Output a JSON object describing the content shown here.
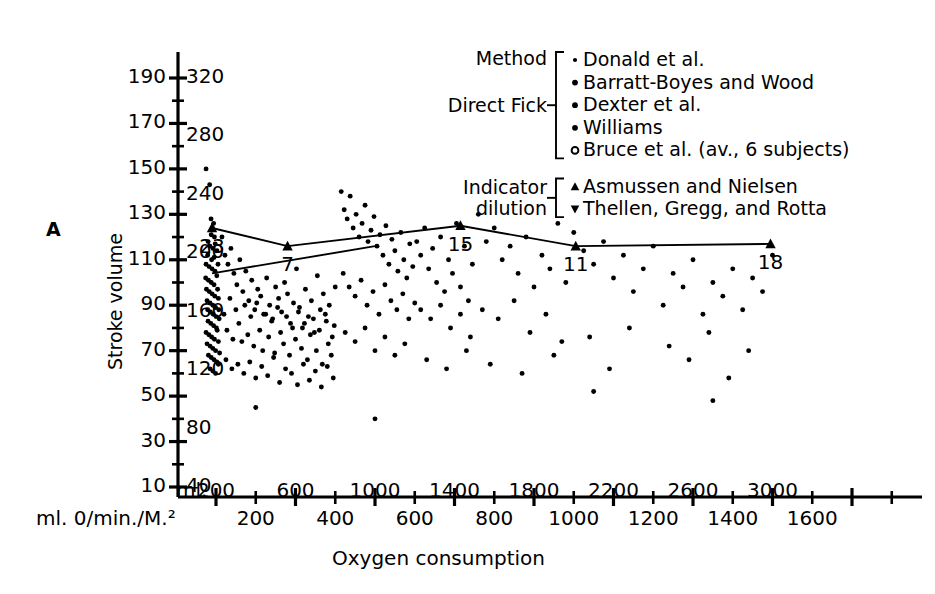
{
  "panel": {
    "label": "A"
  },
  "axes": {
    "y_title": "Stroke volume",
    "y_left_ticks": [
      190,
      170,
      150,
      130,
      110,
      90,
      70,
      50,
      30,
      10
    ],
    "y_right_ticks": [
      320,
      280,
      240,
      200,
      160,
      120,
      80,
      40
    ],
    "x_title": "Oxygen consumption",
    "x_unit_label": "ml. 0/min./M.²",
    "x_top_prefix": "ml.",
    "x_top_ticks": [
      200,
      600,
      1000,
      1400,
      1800,
      2200,
      2600,
      3000
    ],
    "x_bottom_ticks": [
      200,
      400,
      600,
      800,
      1000,
      1200,
      1400,
      1600
    ]
  },
  "legend": {
    "header": "Method",
    "groups": [
      {
        "name": "Direct Fick",
        "lines": [
          "Direct Fick"
        ],
        "entries": [
          {
            "marker": "dot-small",
            "label": "Donald et al."
          },
          {
            "marker": "dot",
            "label": "Barratt-Boyes and Wood"
          },
          {
            "marker": "dot",
            "label": "Dexter et al."
          },
          {
            "marker": "dot",
            "label": "Williams"
          },
          {
            "marker": "circle-open",
            "label": "Bruce et al. (av., 6 subjects)"
          }
        ]
      },
      {
        "name": "Indicator dilution",
        "lines": [
          "Indicator",
          "dilution"
        ],
        "entries": [
          {
            "marker": "triangle-up",
            "label": "Asmussen and Nielsen"
          },
          {
            "marker": "triangle-down",
            "label": "Thellen, Gregg, and Rotta"
          }
        ]
      }
    ]
  },
  "chart_data": {
    "type": "scatter",
    "title": "",
    "xlabel": "Oxygen consumption",
    "ylabel": "Stroke volume",
    "xlim": [
      0,
      3100
    ],
    "ylim": [
      10,
      200
    ],
    "grid": false,
    "legend_position": "top-right",
    "x_secondary_scale_ratio": 0.5,
    "mean_line": {
      "name": "mean stroke volume trend",
      "labels": [
        "23",
        "7",
        "15",
        "11",
        "18"
      ],
      "x": [
        180,
        560,
        1430,
        2010,
        2990
      ],
      "y": [
        124,
        116,
        125,
        116,
        117
      ],
      "marker": "triangle-up"
    },
    "regression_line": {
      "name": "lower trend line",
      "x": [
        180,
        1000
      ],
      "y": [
        104,
        116
      ]
    },
    "points": [
      [
        150,
        150
      ],
      [
        168,
        143
      ],
      [
        175,
        128
      ],
      [
        182,
        124
      ],
      [
        188,
        126
      ],
      [
        176,
        121
      ],
      [
        192,
        120
      ],
      [
        160,
        118
      ],
      [
        170,
        116
      ],
      [
        185,
        115
      ],
      [
        196,
        117
      ],
      [
        158,
        112
      ],
      [
        178,
        110
      ],
      [
        190,
        111
      ],
      [
        205,
        114
      ],
      [
        150,
        108
      ],
      [
        165,
        107
      ],
      [
        180,
        106
      ],
      [
        195,
        105
      ],
      [
        210,
        108
      ],
      [
        148,
        102
      ],
      [
        162,
        101
      ],
      [
        176,
        100
      ],
      [
        190,
        99
      ],
      [
        204,
        103
      ],
      [
        152,
        97
      ],
      [
        166,
        96
      ],
      [
        180,
        95
      ],
      [
        194,
        94
      ],
      [
        208,
        97
      ],
      [
        155,
        92
      ],
      [
        170,
        91
      ],
      [
        184,
        90
      ],
      [
        198,
        89
      ],
      [
        212,
        93
      ],
      [
        158,
        88
      ],
      [
        172,
        87
      ],
      [
        186,
        86
      ],
      [
        200,
        85
      ],
      [
        214,
        88
      ],
      [
        160,
        83
      ],
      [
        174,
        82
      ],
      [
        188,
        81
      ],
      [
        202,
        80
      ],
      [
        216,
        84
      ],
      [
        150,
        78
      ],
      [
        164,
        77
      ],
      [
        178,
        76
      ],
      [
        192,
        75
      ],
      [
        206,
        79
      ],
      [
        155,
        73
      ],
      [
        170,
        72
      ],
      [
        184,
        71
      ],
      [
        198,
        70
      ],
      [
        212,
        74
      ],
      [
        162,
        68
      ],
      [
        176,
        67
      ],
      [
        190,
        66
      ],
      [
        204,
        65
      ],
      [
        218,
        69
      ],
      [
        170,
        62
      ],
      [
        184,
        61
      ],
      [
        198,
        60
      ],
      [
        212,
        64
      ],
      [
        230,
        120
      ],
      [
        245,
        112
      ],
      [
        260,
        108
      ],
      [
        275,
        115
      ],
      [
        290,
        104
      ],
      [
        305,
        99
      ],
      [
        320,
        110
      ],
      [
        335,
        96
      ],
      [
        350,
        105
      ],
      [
        365,
        92
      ],
      [
        380,
        101
      ],
      [
        395,
        88
      ],
      [
        410,
        97
      ],
      [
        425,
        94
      ],
      [
        440,
        86
      ],
      [
        455,
        102
      ],
      [
        470,
        90
      ],
      [
        485,
        84
      ],
      [
        500,
        98
      ],
      [
        515,
        93
      ],
      [
        530,
        87
      ],
      [
        545,
        100
      ],
      [
        560,
        95
      ],
      [
        575,
        82
      ],
      [
        590,
        91
      ],
      [
        605,
        106
      ],
      [
        620,
        89
      ],
      [
        635,
        80
      ],
      [
        650,
        97
      ],
      [
        665,
        85
      ],
      [
        680,
        92
      ],
      [
        695,
        78
      ],
      [
        710,
        103
      ],
      [
        725,
        88
      ],
      [
        740,
        95
      ],
      [
        755,
        83
      ],
      [
        770,
        90
      ],
      [
        785,
        76
      ],
      [
        800,
        98
      ],
      [
        240,
        86
      ],
      [
        255,
        79
      ],
      [
        270,
        93
      ],
      [
        285,
        75
      ],
      [
        300,
        88
      ],
      [
        315,
        82
      ],
      [
        330,
        74
      ],
      [
        345,
        90
      ],
      [
        360,
        77
      ],
      [
        375,
        85
      ],
      [
        390,
        72
      ],
      [
        405,
        91
      ],
      [
        420,
        79
      ],
      [
        435,
        70
      ],
      [
        450,
        86
      ],
      [
        465,
        76
      ],
      [
        480,
        83
      ],
      [
        495,
        69
      ],
      [
        510,
        89
      ],
      [
        525,
        78
      ],
      [
        540,
        73
      ],
      [
        555,
        85
      ],
      [
        570,
        68
      ],
      [
        585,
        80
      ],
      [
        600,
        75
      ],
      [
        615,
        87
      ],
      [
        630,
        71
      ],
      [
        645,
        82
      ],
      [
        660,
        66
      ],
      [
        675,
        77
      ],
      [
        690,
        84
      ],
      [
        705,
        70
      ],
      [
        720,
        79
      ],
      [
        735,
        64
      ],
      [
        750,
        86
      ],
      [
        765,
        73
      ],
      [
        780,
        68
      ],
      [
        795,
        81
      ],
      [
        250,
        66
      ],
      [
        280,
        62
      ],
      [
        310,
        64
      ],
      [
        340,
        60
      ],
      [
        370,
        65
      ],
      [
        400,
        58
      ],
      [
        430,
        63
      ],
      [
        460,
        59
      ],
      [
        490,
        67
      ],
      [
        520,
        56
      ],
      [
        550,
        62
      ],
      [
        580,
        60
      ],
      [
        610,
        55
      ],
      [
        640,
        64
      ],
      [
        670,
        57
      ],
      [
        700,
        61
      ],
      [
        730,
        54
      ],
      [
        760,
        63
      ],
      [
        790,
        58
      ],
      [
        830,
        140
      ],
      [
        845,
        132
      ],
      [
        860,
        128
      ],
      [
        875,
        138
      ],
      [
        890,
        124
      ],
      [
        905,
        130
      ],
      [
        920,
        120
      ],
      [
        935,
        126
      ],
      [
        950,
        134
      ],
      [
        965,
        118
      ],
      [
        980,
        123
      ],
      [
        995,
        129
      ],
      [
        1010,
        116
      ],
      [
        1025,
        121
      ],
      [
        1040,
        112
      ],
      [
        1055,
        125
      ],
      [
        1070,
        108
      ],
      [
        1085,
        119
      ],
      [
        1100,
        114
      ],
      [
        1115,
        105
      ],
      [
        1130,
        122
      ],
      [
        1145,
        110
      ],
      [
        1160,
        102
      ],
      [
        1175,
        117
      ],
      [
        1190,
        107
      ],
      [
        840,
        104
      ],
      [
        870,
        98
      ],
      [
        900,
        94
      ],
      [
        930,
        101
      ],
      [
        960,
        90
      ],
      [
        990,
        96
      ],
      [
        1020,
        86
      ],
      [
        1050,
        99
      ],
      [
        1080,
        92
      ],
      [
        1110,
        88
      ],
      [
        1140,
        95
      ],
      [
        1170,
        84
      ],
      [
        1200,
        91
      ],
      [
        850,
        78
      ],
      [
        900,
        74
      ],
      [
        950,
        80
      ],
      [
        1000,
        70
      ],
      [
        1050,
        76
      ],
      [
        1100,
        68
      ],
      [
        1150,
        73
      ],
      [
        1210,
        118
      ],
      [
        1230,
        112
      ],
      [
        1250,
        124
      ],
      [
        1270,
        106
      ],
      [
        1290,
        115
      ],
      [
        1310,
        100
      ],
      [
        1330,
        120
      ],
      [
        1350,
        96
      ],
      [
        1370,
        110
      ],
      [
        1390,
        104
      ],
      [
        1410,
        126
      ],
      [
        1430,
        98
      ],
      [
        1450,
        116
      ],
      [
        1470,
        92
      ],
      [
        1490,
        108
      ],
      [
        1230,
        88
      ],
      [
        1280,
        84
      ],
      [
        1330,
        90
      ],
      [
        1380,
        80
      ],
      [
        1430,
        86
      ],
      [
        1480,
        76
      ],
      [
        1260,
        66
      ],
      [
        1360,
        62
      ],
      [
        1460,
        70
      ],
      [
        1520,
        130
      ],
      [
        1560,
        118
      ],
      [
        1600,
        124
      ],
      [
        1640,
        110
      ],
      [
        1680,
        116
      ],
      [
        1720,
        104
      ],
      [
        1760,
        120
      ],
      [
        1800,
        98
      ],
      [
        1840,
        112
      ],
      [
        1880,
        106
      ],
      [
        1920,
        126
      ],
      [
        1960,
        100
      ],
      [
        1540,
        88
      ],
      [
        1620,
        84
      ],
      [
        1700,
        92
      ],
      [
        1780,
        78
      ],
      [
        1860,
        86
      ],
      [
        1940,
        74
      ],
      [
        1580,
        64
      ],
      [
        1740,
        60
      ],
      [
        1900,
        68
      ],
      [
        2000,
        122
      ],
      [
        2050,
        114
      ],
      [
        2100,
        108
      ],
      [
        2150,
        118
      ],
      [
        2200,
        102
      ],
      [
        2250,
        112
      ],
      [
        2300,
        96
      ],
      [
        2350,
        106
      ],
      [
        2400,
        116
      ],
      [
        2450,
        90
      ],
      [
        2500,
        104
      ],
      [
        2550,
        98
      ],
      [
        2600,
        110
      ],
      [
        2650,
        86
      ],
      [
        2700,
        100
      ],
      [
        2750,
        94
      ],
      [
        2800,
        106
      ],
      [
        2850,
        88
      ],
      [
        2900,
        102
      ],
      [
        2950,
        96
      ],
      [
        3000,
        112
      ],
      [
        2080,
        76
      ],
      [
        2280,
        80
      ],
      [
        2480,
        72
      ],
      [
        2680,
        78
      ],
      [
        2880,
        70
      ],
      [
        2180,
        62
      ],
      [
        2580,
        66
      ],
      [
        2780,
        58
      ],
      [
        400,
        45
      ],
      [
        1000,
        40
      ],
      [
        2100,
        52
      ],
      [
        2700,
        48
      ]
    ]
  }
}
